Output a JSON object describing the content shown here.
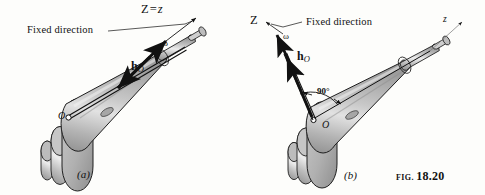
{
  "figure": {
    "caption_prefix": "FIG.",
    "caption_number": "18.20",
    "background_color": "#fdfdfb",
    "ink_color": "#111111",
    "body_fill_light": "#d9d9d9",
    "body_fill_mid": "#bdbdbd",
    "body_fill_dark": "#9a9a9a",
    "body_highlight": "#f0f0f0",
    "outline_color": "#1a1a1a"
  },
  "panels": [
    {
      "id": "a",
      "sub_caption": "(a)",
      "labels": {
        "fixed_direction": "Fixed direction",
        "axis_upper": "Z",
        "axis_equals": "=",
        "axis_lower": "z",
        "omega": "ω",
        "momentum_symbol": "h",
        "momentum_subscript": "O",
        "point_o": "O"
      }
    },
    {
      "id": "b",
      "sub_caption": "(b)",
      "labels": {
        "fixed_direction": "Fixed direction",
        "axis_upper": "Z",
        "axis_lower": "z",
        "omega": "ω",
        "momentum_symbol": "h",
        "momentum_subscript": "O",
        "point_o": "O",
        "angle": "90°"
      }
    }
  ]
}
